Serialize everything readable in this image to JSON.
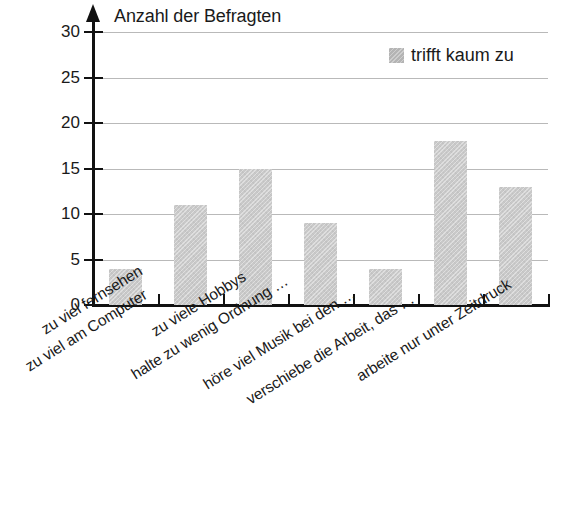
{
  "chart_data": {
    "type": "bar",
    "title": "Anzahl der Befragten",
    "xlabel": "",
    "ylabel": "Anzahl der Befragten",
    "ylim": [
      0,
      30
    ],
    "yticks": [
      0,
      5,
      10,
      15,
      20,
      25,
      30
    ],
    "grid": true,
    "legend_position": "top-right",
    "categories": [
      "zu viel fernsehen",
      "zu viel am Computer",
      "zu viele Hobbys",
      "halte zu wenig Ordnung …",
      "höre viel Musik bei den …",
      "verschiebe die Arbeit, das …",
      "arbeite nur unter Zeitdruck"
    ],
    "series": [
      {
        "name": "trifft kaum zu",
        "color": "#c9c9c9",
        "values": [
          4,
          11,
          15,
          9,
          4,
          18,
          13
        ]
      }
    ]
  },
  "axis": {
    "title": "Anzahl der Befragten",
    "y_tick_labels": [
      "30",
      "25",
      "20",
      "15",
      "10",
      "5",
      "0"
    ]
  },
  "legend": {
    "entries": [
      {
        "label": "trifft kaum zu",
        "color": "#b4b4b4"
      }
    ]
  }
}
